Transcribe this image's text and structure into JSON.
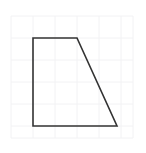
{
  "figure": {
    "canvas": {
      "width": 146,
      "height": 153,
      "background_color": "#ffffff"
    },
    "grid": {
      "visible": true,
      "line_color": "#f2f2f4",
      "line_width": 1,
      "cell_width": 22,
      "cell_height": 22,
      "x_start": 11,
      "x_end": 133,
      "y_start": 16,
      "y_end": 138,
      "vertical_lines_x": [
        11,
        33,
        55,
        77,
        99,
        121,
        133
      ],
      "horizontal_lines_y": [
        16,
        38,
        60,
        82,
        104,
        126,
        138
      ],
      "columns": 6,
      "rows": 6
    },
    "shape": {
      "name": "trapezoid",
      "type": "polygon",
      "stroke_color": "#333333",
      "stroke_width": 1.6,
      "fill_color": "none",
      "vertex_count": 4,
      "points": "33,38 77,38 117,126 33,126",
      "vertices": [
        {
          "label": "top-left",
          "x": 33,
          "y": 38
        },
        {
          "label": "top-right",
          "x": 77,
          "y": 38
        },
        {
          "label": "bottom-right",
          "x": 117,
          "y": 126
        },
        {
          "label": "bottom-left",
          "x": 33,
          "y": 126
        }
      ],
      "edges": [
        {
          "label": "top-edge",
          "from": "top-left",
          "to": "top-right",
          "orientation": "horizontal",
          "grid_units": 2
        },
        {
          "label": "right-slanted-edge",
          "from": "top-right",
          "to": "bottom-right",
          "orientation": "diagonal"
        },
        {
          "label": "bottom-edge",
          "from": "bottom-right",
          "to": "bottom-left",
          "orientation": "horizontal",
          "grid_units": 4
        },
        {
          "label": "left-edge",
          "from": "bottom-left",
          "to": "top-left",
          "orientation": "vertical",
          "grid_units": 4
        }
      ]
    }
  }
}
